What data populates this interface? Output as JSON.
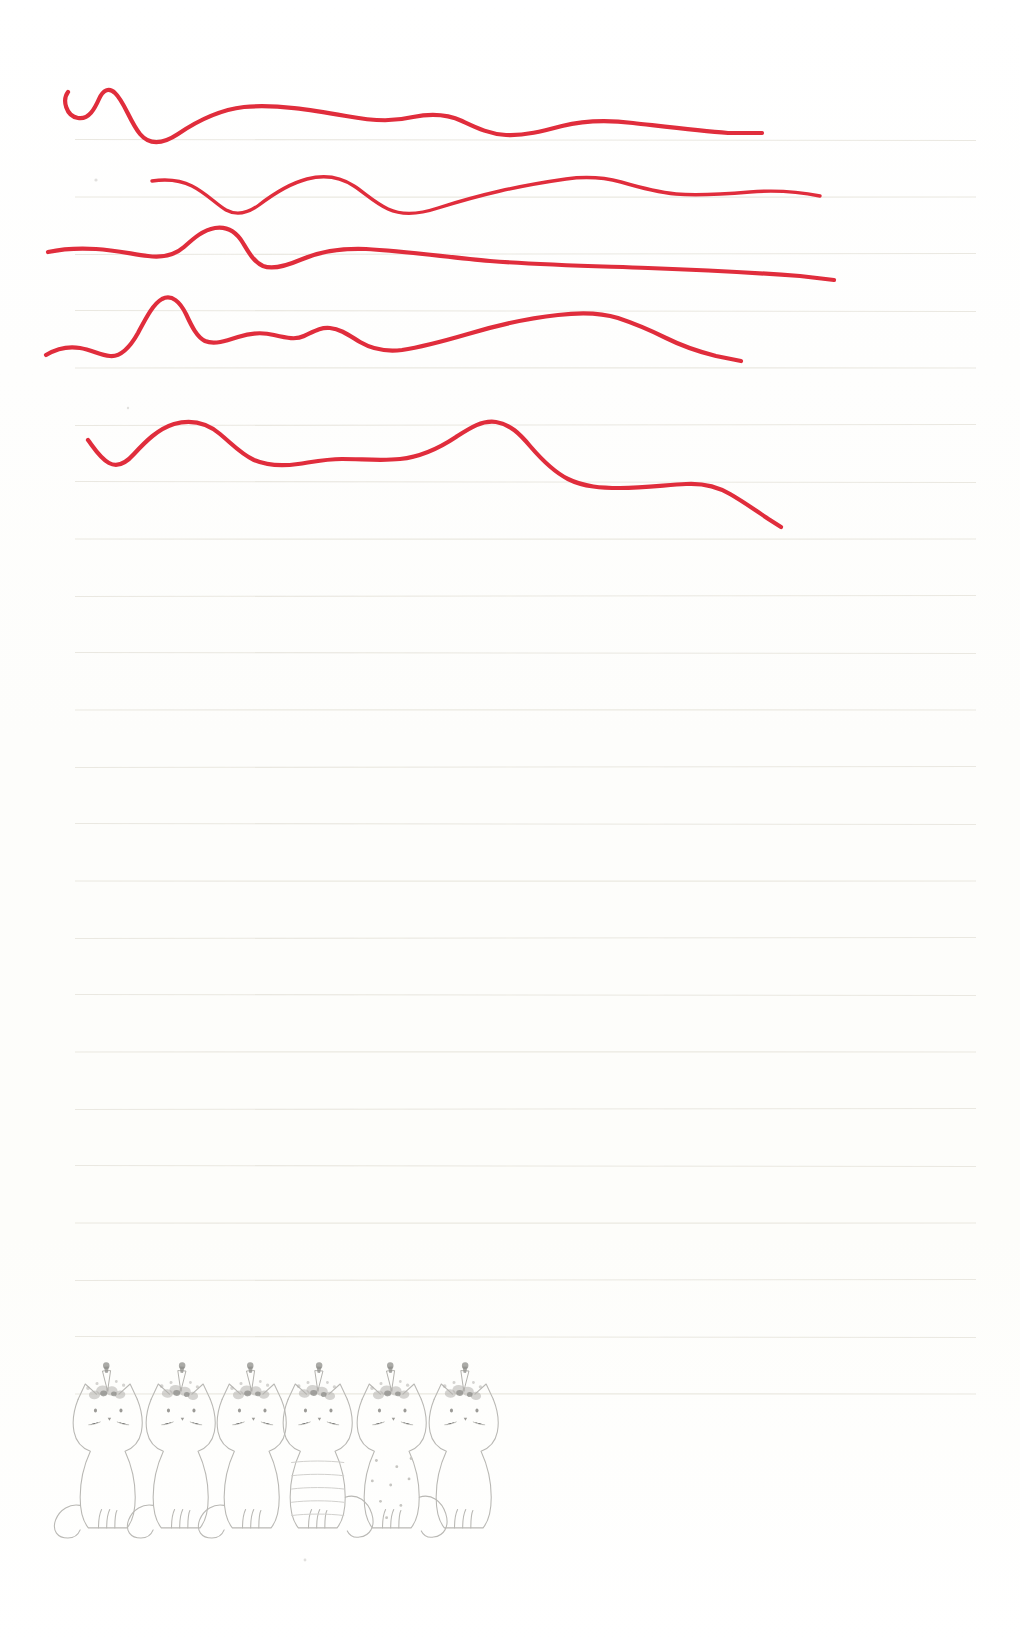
{
  "page": {
    "width": 1020,
    "height": 1645,
    "paper_color": "#fefefe",
    "rule_color": "#e9e7df",
    "ink_red": "#e02d3c",
    "pencil_gray": "#b9b8b4"
  },
  "ruled_lines": {
    "name": "ruled-guide-lines",
    "count": 23,
    "first_y": 140,
    "spacing": 57,
    "x_start": 75,
    "x_end": 976,
    "color": "#e9e7df"
  },
  "red_strokes": {
    "name": "red-pen-wavy-lines",
    "count": 5,
    "color": "#e02d3c",
    "description": "Five freehand horizontal wavy pen lines drawn across the top third of the page",
    "items": [
      {
        "id": "red-line-1",
        "label": "Wavy line 1",
        "start_x": 68,
        "start_y": 92,
        "end_x": 762,
        "end_y": 133
      },
      {
        "id": "red-line-2",
        "label": "Wavy line 2",
        "start_x": 152,
        "start_y": 181,
        "end_x": 820,
        "end_y": 196
      },
      {
        "id": "red-line-3",
        "label": "Wavy line 3",
        "start_x": 48,
        "start_y": 252,
        "end_x": 834,
        "end_y": 280
      },
      {
        "id": "red-line-4",
        "label": "Wavy line 4",
        "start_x": 46,
        "start_y": 355,
        "end_x": 741,
        "end_y": 361
      },
      {
        "id": "red-line-5",
        "label": "Wavy line 5",
        "start_x": 88,
        "start_y": 440,
        "end_x": 781,
        "end_y": 527
      }
    ]
  },
  "cats": {
    "name": "pencil-cat-row",
    "count": 6,
    "label": "Row of six pencil-drawn sitting cats wearing flower crowns with unicorn horns",
    "baseline_y": 1525,
    "items": [
      {
        "id": "cat-1",
        "x": 72,
        "pattern": "plain",
        "tail": "left",
        "crown": "flower-crown-horn"
      },
      {
        "id": "cat-2",
        "x": 145,
        "pattern": "plain",
        "tail": "left",
        "crown": "flower-crown-horn"
      },
      {
        "id": "cat-3",
        "x": 216,
        "pattern": "plain",
        "tail": "left",
        "crown": "flower-crown-horn"
      },
      {
        "id": "cat-4",
        "x": 282,
        "pattern": "striped",
        "tail": "right",
        "crown": "flower-crown-horn"
      },
      {
        "id": "cat-5",
        "x": 356,
        "pattern": "dotted",
        "tail": "right",
        "crown": "flower-crown-horn"
      },
      {
        "id": "cat-6",
        "x": 428,
        "pattern": "plain",
        "tail": "none",
        "crown": "flower-crown-horn"
      }
    ]
  },
  "smudges": {
    "name": "paper-smudges",
    "items": [
      {
        "x": 96,
        "y": 180,
        "r": 1.6
      },
      {
        "x": 128,
        "y": 408,
        "r": 1.2
      },
      {
        "x": 305,
        "y": 1560,
        "r": 1.4
      }
    ]
  }
}
